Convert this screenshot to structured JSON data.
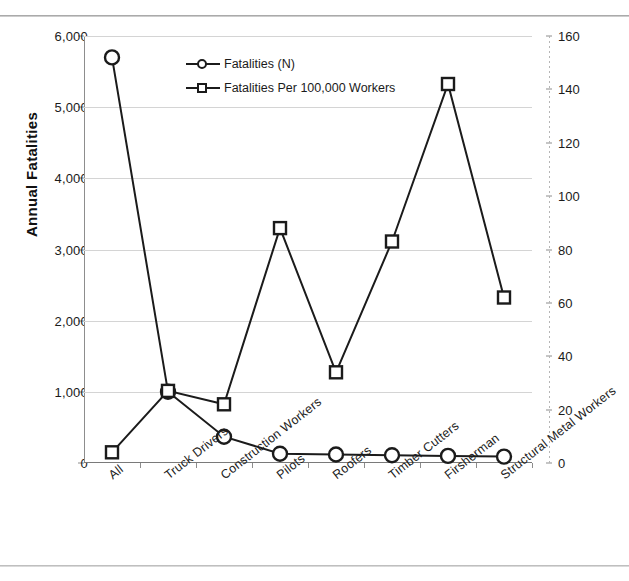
{
  "chart_data": {
    "type": "line",
    "title": "",
    "xlabel": "",
    "categories": [
      "All",
      "Truck Drivers",
      "Construction Workers",
      "Pilots",
      "Roofers",
      "Timber Cutters",
      "Firsherman",
      "Structural Metal Workers"
    ],
    "series": [
      {
        "name": "Fatalities (N)",
        "axis": "left",
        "marker": "circle",
        "values": [
          5700,
          1000,
          370,
          130,
          120,
          110,
          100,
          90
        ]
      },
      {
        "name": "Fatalities Per 100,000 Workers",
        "axis": "right",
        "marker": "square",
        "values": [
          4,
          27,
          22,
          88,
          34,
          83,
          142,
          62
        ]
      }
    ],
    "y_left": {
      "label": "Annual Fatalities",
      "ticks": [
        "0",
        "1,000",
        "2,000",
        "3,000",
        "4,000",
        "5,000",
        "6,000"
      ],
      "tick_values": [
        0,
        1000,
        2000,
        3000,
        4000,
        5000,
        6000
      ],
      "ylim": [
        0,
        6000
      ]
    },
    "y_right": {
      "label": "Fatality Incidence (Fatalities Per 100,000 Workers)",
      "ticks": [
        "0",
        "20",
        "40",
        "60",
        "80",
        "100",
        "120",
        "140",
        "160"
      ],
      "tick_values": [
        0,
        20,
        40,
        60,
        80,
        100,
        120,
        140,
        160
      ],
      "ylim": [
        0,
        160
      ]
    },
    "grid": true,
    "legend_position": "top-center",
    "legend": [
      "Fatalities (N)",
      "Fatalities Per 100,000 Workers"
    ]
  }
}
